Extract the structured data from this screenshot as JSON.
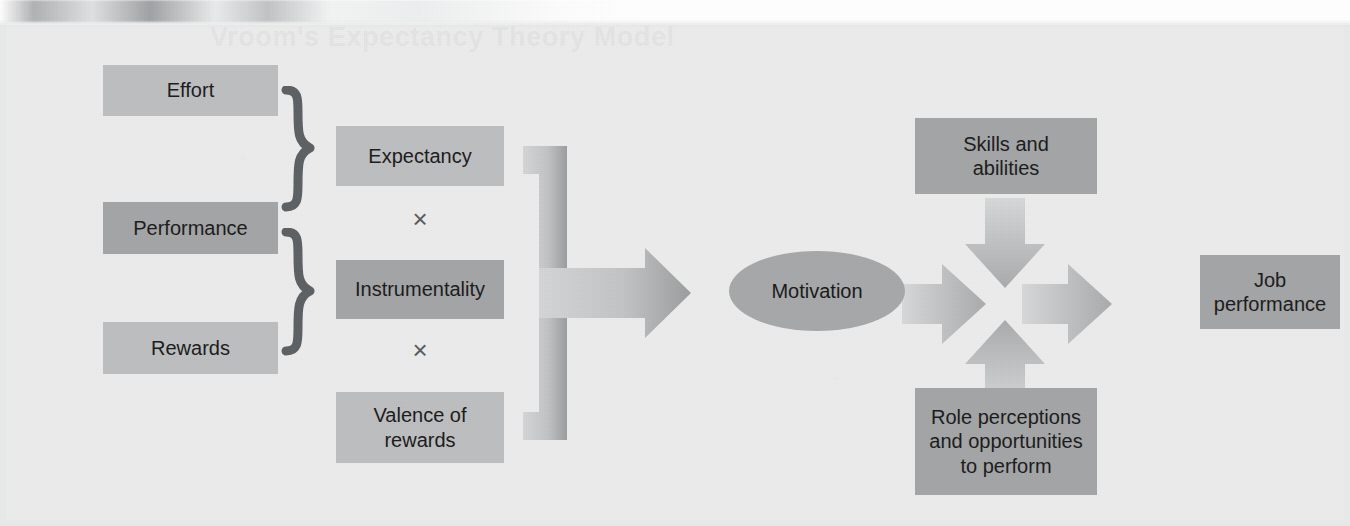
{
  "figure": {
    "kind": "expectancy-theory-diagram",
    "ghost_header_text": "Vroom's Expectancy Theory Model"
  },
  "inputs": {
    "effort": "Effort",
    "performance": "Performance",
    "rewards": "Rewards"
  },
  "components": {
    "expectancy": "Expectancy",
    "instrumentality": "Instrumentality",
    "valence": "Valence of\nrewards",
    "valence_line1": "Valence of",
    "valence_line2": "rewards",
    "operator_top": "×",
    "operator_bottom": "×"
  },
  "outcome": {
    "motivation": "Motivation"
  },
  "moderators": {
    "skills_line1": "Skills and",
    "skills_line2": "abilities",
    "role_line1": "Role perceptions",
    "role_line2": "and opportunities",
    "role_line3": "to perform"
  },
  "result": {
    "job_line1": "Job",
    "job_line2": "performance"
  },
  "colors": {
    "page_background": "#ececec",
    "box_dark": "#a3a5a6",
    "box_light": "#bcbebf",
    "ellipse": "#a6a8a9",
    "brace": "#5e6164",
    "arrow_light": "#c6c8c9",
    "arrow_dark": "#9a9c9e",
    "text": "#1c1c1c"
  }
}
